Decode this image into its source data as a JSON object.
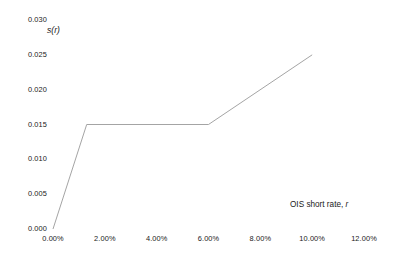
{
  "chart_data": {
    "type": "line",
    "title": "",
    "subtitle": "",
    "xlabel": "OIS short rate, r",
    "ylabel": "s(r)",
    "xlim": [
      0.0,
      0.12
    ],
    "ylim": [
      0.0,
      0.03
    ],
    "grid": false,
    "legend": null,
    "x_tick_labels": [
      "0.00%",
      "2.00%",
      "4.00%",
      "6.00%",
      "8.00%",
      "10.00%",
      "12.00%"
    ],
    "x_tick_values": [
      0.0,
      0.02,
      0.04,
      0.06,
      0.08,
      0.1,
      0.12
    ],
    "y_tick_labels": [
      "0.000",
      "0.005",
      "0.010",
      "0.015",
      "0.020",
      "0.025",
      "0.030"
    ],
    "y_tick_values": [
      0.0,
      0.005,
      0.01,
      0.015,
      0.02,
      0.025,
      0.03
    ],
    "series": [
      {
        "name": "s(r)",
        "color": "#9a9a9a",
        "x": [
          0.0,
          0.013,
          0.06,
          0.1
        ],
        "values": [
          0.0,
          0.015,
          0.015,
          0.025
        ]
      }
    ]
  },
  "axis_titles": {
    "y": "s(r)",
    "x_prefix": "OIS short rate, ",
    "x_variable": "r"
  },
  "colors": {
    "line": "#9a9a9a",
    "text": "#1a1a1a",
    "background": "#ffffff"
  }
}
